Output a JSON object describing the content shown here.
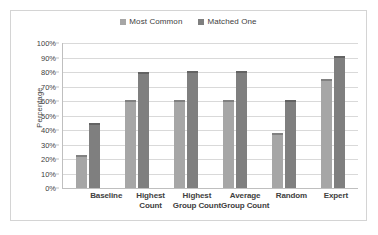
{
  "chart_data": {
    "type": "bar",
    "title": "",
    "subtitle": "",
    "xlabel": "",
    "ylabel": "Percentage",
    "ylim": [
      0,
      100
    ],
    "y_tick_labels": [
      "100%",
      "90%",
      "80%",
      "70%",
      "60%",
      "50%",
      "40%",
      "30%",
      "20%",
      "10%",
      "0%"
    ],
    "y_tick_values": [
      100,
      90,
      80,
      70,
      60,
      50,
      40,
      30,
      20,
      10,
      0
    ],
    "grid": true,
    "legend_position": "top-center",
    "categories": [
      "Baseline",
      "Highest Count",
      "Highest Group Count",
      "Average Group Count",
      "Random",
      "Expert"
    ],
    "category_lines": [
      [
        "Baseline"
      ],
      [
        "Highest",
        "Count"
      ],
      [
        "Highest",
        "Group Count"
      ],
      [
        "Average",
        "Group Count"
      ],
      [
        "Random"
      ],
      [
        "Expert"
      ]
    ],
    "series": [
      {
        "name": "Most Common",
        "color": "#a6a6a6",
        "values": [
          23,
          61,
          61,
          61,
          38,
          75
        ]
      },
      {
        "name": "Matched One",
        "color": "#7f7f7f",
        "values": [
          45,
          80,
          81,
          81,
          61,
          91
        ]
      }
    ],
    "value_unit": "%",
    "error_bars": true,
    "border_color": "#d4d4d4",
    "gridline_color": "#d9d9d9",
    "axis_color": "#bfbfbf",
    "text_color": "#404040"
  }
}
